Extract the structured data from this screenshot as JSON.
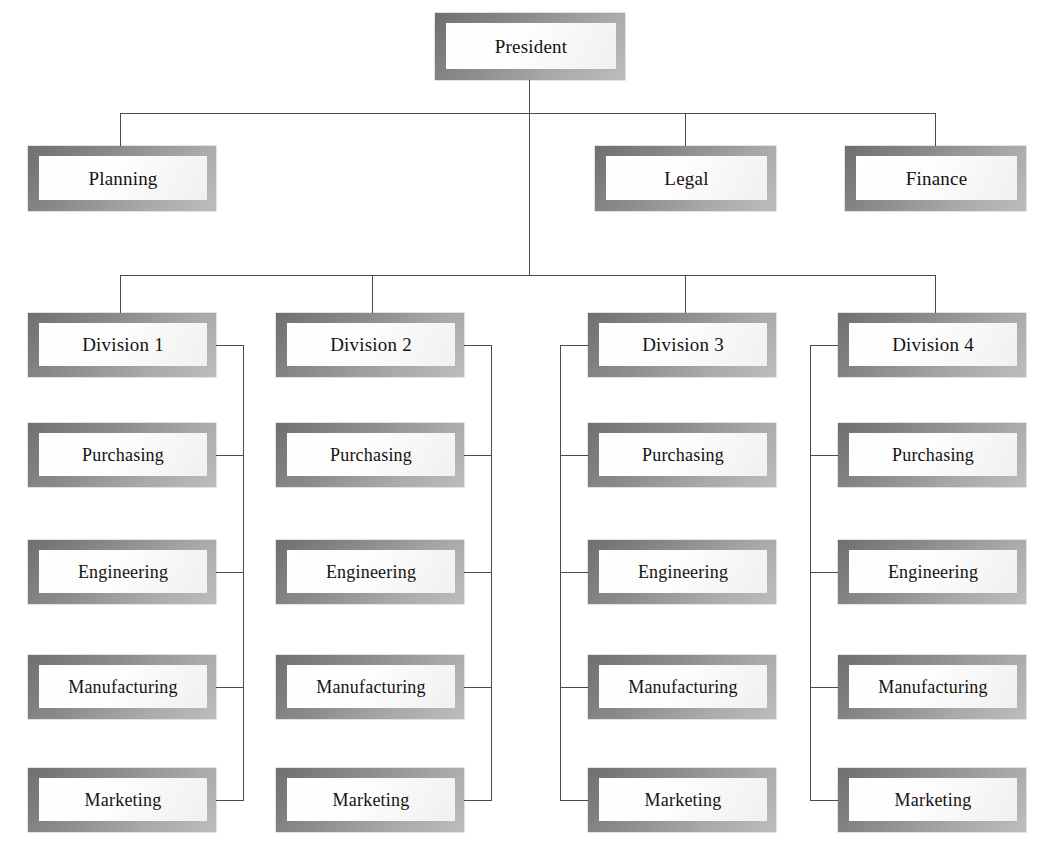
{
  "diagram": {
    "type": "org-chart",
    "background_color": "#ffffff",
    "box_border_color": "#8a8a8a",
    "box_fill_color": "#ffffff",
    "line_color": "#4a4a4a",
    "text_color": "#15120f"
  },
  "root": {
    "label": "President"
  },
  "staff": [
    {
      "label": "Planning"
    },
    {
      "label": "Legal"
    },
    {
      "label": "Finance"
    }
  ],
  "divisions": [
    {
      "label": "Division 1",
      "spine_side": "right",
      "departments": [
        {
          "label": "Purchasing"
        },
        {
          "label": "Engineering"
        },
        {
          "label": "Manufacturing"
        },
        {
          "label": "Marketing"
        }
      ]
    },
    {
      "label": "Division 2",
      "spine_side": "right",
      "departments": [
        {
          "label": "Purchasing"
        },
        {
          "label": "Engineering"
        },
        {
          "label": "Manufacturing"
        },
        {
          "label": "Marketing"
        }
      ]
    },
    {
      "label": "Division 3",
      "spine_side": "left",
      "departments": [
        {
          "label": "Purchasing"
        },
        {
          "label": "Engineering"
        },
        {
          "label": "Manufacturing"
        },
        {
          "label": "Marketing"
        }
      ]
    },
    {
      "label": "Division 4",
      "spine_side": "left",
      "departments": [
        {
          "label": "Purchasing"
        },
        {
          "label": "Engineering"
        },
        {
          "label": "Manufacturing"
        },
        {
          "label": "Marketing"
        }
      ]
    }
  ]
}
